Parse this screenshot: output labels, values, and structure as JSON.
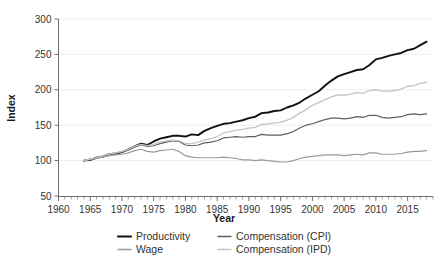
{
  "chart_data": {
    "type": "line",
    "title": "",
    "xlabel": "Year",
    "ylabel": "Index",
    "xlim": [
      1960,
      2019
    ],
    "ylim": [
      50,
      300
    ],
    "ytick_values": [
      50,
      100,
      150,
      200,
      250,
      300
    ],
    "ytick_labels": [
      "50",
      "100",
      "150",
      "200",
      "250",
      "300"
    ],
    "xtick_values": [
      1960,
      1965,
      1970,
      1975,
      1980,
      1985,
      1990,
      1995,
      2000,
      2005,
      2010,
      2015
    ],
    "xtick_labels": [
      "1960",
      "1965",
      "1970",
      "1975",
      "1980",
      "1985",
      "1990",
      "1995",
      "2000",
      "2005",
      "2010",
      "2015"
    ],
    "minor_xtick_step": 1,
    "grid": "horizontal-major-only",
    "legend_position": "bottom",
    "legend_columns": 2,
    "x": [
      1964,
      1965,
      1966,
      1967,
      1968,
      1969,
      1970,
      1971,
      1972,
      1973,
      1974,
      1975,
      1976,
      1977,
      1978,
      1979,
      1980,
      1981,
      1982,
      1983,
      1984,
      1985,
      1986,
      1987,
      1988,
      1989,
      1990,
      1991,
      1992,
      1993,
      1994,
      1995,
      1996,
      1997,
      1998,
      1999,
      2000,
      2001,
      2002,
      2003,
      2004,
      2005,
      2006,
      2007,
      2008,
      2009,
      2010,
      2011,
      2012,
      2013,
      2014,
      2015,
      2016,
      2017,
      2018
    ],
    "series": [
      {
        "name": "Productivity",
        "color": "#111111",
        "width": 1.9,
        "values": [
          100,
          101,
          104,
          106,
          109,
          110,
          112,
          116,
          120,
          124,
          122,
          127,
          131,
          133,
          135,
          135,
          134,
          137,
          136,
          142,
          146,
          149,
          152,
          153,
          155,
          157,
          160,
          162,
          167,
          168,
          170,
          171,
          175,
          178,
          182,
          188,
          193,
          198,
          206,
          213,
          219,
          222,
          225,
          228,
          229,
          235,
          243,
          245,
          248,
          250,
          252,
          256,
          258,
          263,
          268
        ]
      },
      {
        "name": "Compensation (CPI)",
        "color": "#5f5f5f",
        "width": 1.2,
        "values": [
          100,
          102,
          104,
          106,
          109,
          110,
          112,
          115,
          119,
          122,
          120,
          121,
          124,
          126,
          128,
          127,
          122,
          121,
          122,
          125,
          126,
          128,
          132,
          133,
          134,
          133,
          134,
          134,
          137,
          136,
          136,
          136,
          138,
          141,
          146,
          150,
          152,
          155,
          158,
          160,
          160,
          159,
          160,
          162,
          161,
          164,
          164,
          161,
          160,
          161,
          162,
          165,
          166,
          165,
          166
        ]
      },
      {
        "name": "Wage",
        "color": "#9a9a9a",
        "width": 1.2,
        "values": [
          100,
          102,
          103,
          105,
          107,
          108,
          109,
          111,
          114,
          116,
          113,
          112,
          114,
          115,
          116,
          113,
          107,
          105,
          104,
          104,
          104,
          104,
          105,
          104,
          103,
          101,
          101,
          100,
          101,
          100,
          99,
          98,
          98,
          100,
          103,
          105,
          106,
          107,
          108,
          108,
          108,
          107,
          108,
          109,
          108,
          111,
          111,
          109,
          109,
          109,
          110,
          112,
          113,
          113,
          114
        ]
      },
      {
        "name": "Compensation (IPD)",
        "color": "#c4c4c4",
        "width": 1.3,
        "values": [
          100,
          102,
          104,
          107,
          109,
          111,
          113,
          116,
          120,
          123,
          121,
          123,
          126,
          128,
          129,
          128,
          124,
          124,
          126,
          129,
          131,
          134,
          139,
          141,
          143,
          144,
          146,
          147,
          151,
          152,
          153,
          154,
          157,
          161,
          167,
          172,
          178,
          182,
          186,
          190,
          193,
          192,
          194,
          196,
          195,
          199,
          200,
          198,
          198,
          199,
          201,
          205,
          206,
          209,
          211
        ]
      }
    ]
  },
  "axes": {
    "x_title": "Year",
    "y_title": "Index"
  },
  "legend": {
    "items": [
      {
        "label": "Productivity",
        "color": "#111111"
      },
      {
        "label": "Compensation (CPI)",
        "color": "#5f5f5f"
      },
      {
        "label": "Wage",
        "color": "#9a9a9a"
      },
      {
        "label": "Compensation (IPD)",
        "color": "#c4c4c4"
      }
    ]
  }
}
